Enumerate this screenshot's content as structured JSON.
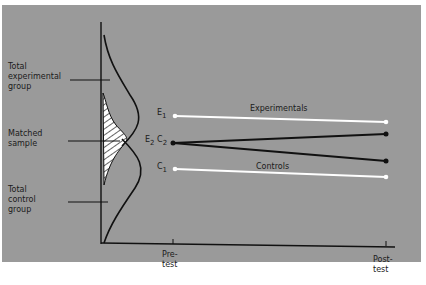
{
  "diagram": {
    "left_labels": {
      "total_experimental": [
        "Total",
        "experimental",
        "group"
      ],
      "matched_sample": [
        "Matched",
        "sample"
      ],
      "total_control": [
        "Total",
        "control",
        "group"
      ]
    },
    "series": [
      {
        "name": "E1",
        "label": "Experimentals",
        "style": "white",
        "from": [
          175,
          116
        ],
        "to": [
          386,
          122
        ]
      },
      {
        "name": "C1",
        "label": "Controls",
        "style": "white",
        "from": [
          175,
          169
        ],
        "to": [
          386,
          177
        ]
      },
      {
        "name": "E2",
        "label": "",
        "style": "black",
        "from": [
          173,
          143
        ],
        "to": [
          386,
          134
        ]
      },
      {
        "name": "C2",
        "label": "",
        "style": "black",
        "from": [
          173,
          143
        ],
        "to": [
          386,
          161
        ]
      }
    ],
    "point_labels": {
      "e1": "E",
      "e1_sub": "1",
      "e2c2_e": "E",
      "e2c2_e_sub": "2",
      "e2c2_c": "C",
      "e2c2_c_sub": "2",
      "c1": "C",
      "c1_sub": "1"
    },
    "line_labels": {
      "experimentals": "Experimentals",
      "controls": "Controls"
    },
    "x_axis": {
      "ticks": [
        {
          "lines": [
            "Pre-",
            "test"
          ]
        },
        {
          "lines": [
            "Post-",
            "test"
          ]
        }
      ]
    },
    "colors": {
      "background": "#9a9a9a",
      "line_dark": "#111111",
      "line_light": "#ffffff"
    }
  }
}
